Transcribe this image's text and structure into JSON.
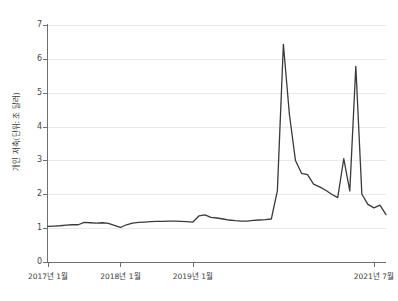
{
  "chart_data": {
    "type": "line",
    "title": "",
    "subtitle": "",
    "xlabel": "",
    "ylabel": "개인 저축(단위: 조 달러)",
    "ylim": [
      0,
      7
    ],
    "yticks": [
      0,
      1,
      2,
      3,
      4,
      5,
      6,
      7
    ],
    "ytick_labels": [
      "0",
      "1",
      "2",
      "3",
      "4",
      "5",
      "6",
      "7"
    ],
    "grid": true,
    "legend": null,
    "legend_position": "none",
    "line_color": "#3a3a3a",
    "xtick_labels": [
      "2017년 1월",
      "2018년 1월",
      "2019년 1월",
      "2021년 7월"
    ],
    "xtick_positions": [
      0,
      12,
      24,
      54
    ],
    "x_range": [
      0,
      56
    ],
    "x": [
      "2017-01",
      "2017-02",
      "2017-03",
      "2017-04",
      "2017-05",
      "2017-06",
      "2017-07",
      "2017-08",
      "2017-09",
      "2017-10",
      "2017-11",
      "2017-12",
      "2018-01",
      "2018-02",
      "2018-03",
      "2018-04",
      "2018-05",
      "2018-06",
      "2018-07",
      "2018-08",
      "2018-09",
      "2018-10",
      "2018-11",
      "2018-12",
      "2019-01",
      "2019-02",
      "2019-03",
      "2019-04",
      "2019-05",
      "2019-06",
      "2019-07",
      "2019-08",
      "2019-09",
      "2019-10",
      "2019-11",
      "2019-12",
      "2020-01",
      "2020-02",
      "2020-03",
      "2020-04",
      "2020-05",
      "2020-06",
      "2020-07",
      "2020-08",
      "2020-09",
      "2020-10",
      "2020-11",
      "2020-12",
      "2021-01",
      "2021-02",
      "2021-03",
      "2021-04",
      "2021-05",
      "2021-06",
      "2021-07",
      "2021-08",
      "2021-09"
    ],
    "values": [
      1.05,
      1.06,
      1.07,
      1.09,
      1.1,
      1.1,
      1.17,
      1.16,
      1.15,
      1.16,
      1.14,
      1.08,
      1.02,
      1.1,
      1.15,
      1.17,
      1.18,
      1.19,
      1.2,
      1.2,
      1.21,
      1.21,
      1.2,
      1.19,
      1.18,
      1.36,
      1.39,
      1.32,
      1.3,
      1.27,
      1.24,
      1.22,
      1.21,
      1.21,
      1.23,
      1.24,
      1.25,
      1.27,
      2.1,
      6.43,
      4.35,
      3.0,
      2.62,
      2.58,
      2.3,
      2.22,
      2.12,
      2.0,
      1.9,
      3.05,
      2.1,
      5.78,
      2.0,
      1.7,
      1.6,
      1.68,
      1.4
    ],
    "annotations": []
  },
  "axes": {
    "y_title": "개인 저축(단위: 조 달러)",
    "y_ticks": [
      "0",
      "1",
      "2",
      "3",
      "4",
      "5",
      "6",
      "7"
    ],
    "x_ticks": [
      "2017년 1월",
      "2018년 1월",
      "2019년 1월",
      "2021년 7월"
    ]
  }
}
